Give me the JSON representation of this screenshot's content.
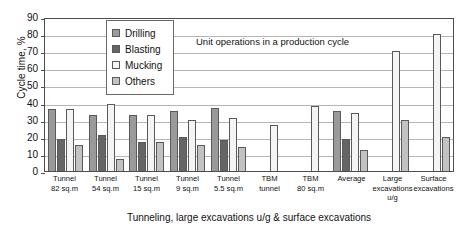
{
  "chart_data": {
    "type": "bar",
    "title": "",
    "annotation": "Unit operations in a production cycle",
    "xlabel": "Tunneling, large excavations u/g & surface excavations",
    "ylabel": "Cycle time, %",
    "ylim": [
      0,
      90
    ],
    "ytick_step": 10,
    "yticks": [
      "90",
      "80",
      "70",
      "60",
      "50",
      "40",
      "30",
      "20",
      "10",
      "0"
    ],
    "grid": true,
    "legend_position": "upper-left-inside",
    "categories": [
      "Tunnel 82 sq.m",
      "Tunnel 54 sq.m",
      "Tunnel 15 sq.m",
      "Tunnel 9 sq.m",
      "Tunnel 5.5 sq.m",
      "TBM tunnel",
      "TBM 80 sq.m",
      "Average",
      "Large excavations u/g",
      "Surface excavations"
    ],
    "category_lines": [
      [
        "Tunnel",
        "82 sq.m"
      ],
      [
        "Tunnel",
        "54 sq.m"
      ],
      [
        "Tunnel",
        "15 sq.m"
      ],
      [
        "Tunnel",
        "9 sq.m"
      ],
      [
        "Tunnel",
        "5.5 sq.m"
      ],
      [
        "TBM",
        "tunnel"
      ],
      [
        "TBM",
        "80 sq.m"
      ],
      [
        "Average",
        ""
      ],
      [
        "Large",
        "excavations",
        "u/g"
      ],
      [
        "Surface",
        "excavations"
      ]
    ],
    "series": [
      {
        "name": "Drilling",
        "color": "#9a9a9a",
        "values": [
          36,
          33,
          33,
          35,
          37,
          null,
          null,
          35,
          null,
          null
        ]
      },
      {
        "name": "Blasting",
        "color": "#656565",
        "values": [
          19,
          21,
          17,
          20,
          18,
          null,
          null,
          19,
          null,
          null
        ]
      },
      {
        "name": "Mucking",
        "color": "#f4f4f4",
        "values": [
          36,
          39,
          33,
          30,
          31,
          27,
          38,
          34,
          70,
          80
        ]
      },
      {
        "name": "Others",
        "color": "#c2c2c2",
        "values": [
          15,
          7,
          17,
          15,
          14,
          null,
          null,
          12,
          30,
          20
        ]
      }
    ]
  }
}
